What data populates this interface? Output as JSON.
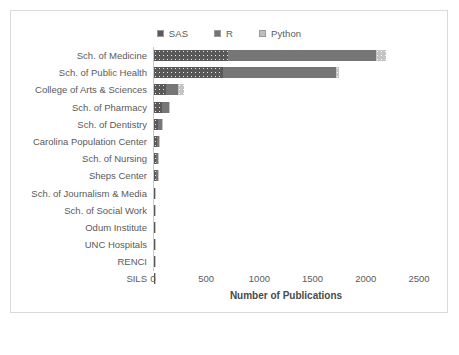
{
  "chart_data": {
    "type": "bar",
    "orientation": "horizontal",
    "stacked": true,
    "title": "",
    "xlabel": "Number of Publications",
    "ylabel": "",
    "xlim": [
      0,
      2500
    ],
    "xticks": [
      0,
      500,
      1000,
      1500,
      2000,
      2500
    ],
    "grid": false,
    "legend_position": "top-center",
    "categories": [
      "Sch. of Medicine",
      "Sch. of Public Health",
      "College of Arts & Sciences",
      "Sch. of Pharmacy",
      "Sch. of Dentistry",
      "Carolina Population Center",
      "Sch. of Nursing",
      "Sheps Center",
      "Sch. of Journalism & Media",
      "Sch. of Social Work",
      "Odum Institute",
      "UNC Hospitals",
      "RENCI",
      "SILS"
    ],
    "series": [
      {
        "name": "SAS",
        "color": "#595959",
        "pattern": "dotted-dark",
        "values": [
          700,
          650,
          110,
          75,
          40,
          25,
          22,
          22,
          8,
          6,
          6,
          5,
          5,
          5
        ]
      },
      {
        "name": "R",
        "color": "#767676",
        "pattern": "solid",
        "values": [
          1390,
          1060,
          115,
          65,
          35,
          18,
          16,
          18,
          6,
          5,
          5,
          4,
          4,
          4
        ]
      },
      {
        "name": "Python",
        "color": "#c4c4c4",
        "pattern": "dotted-light",
        "values": [
          90,
          30,
          55,
          15,
          6,
          4,
          4,
          4,
          2,
          2,
          2,
          2,
          2,
          2
        ]
      }
    ],
    "totals": [
      2180,
      1740,
      280,
      155,
      81,
      47,
      42,
      44,
      16,
      13,
      13,
      11,
      11,
      11
    ]
  },
  "legend": {
    "items": [
      {
        "label": "SAS",
        "swatch_class": "sw-sas"
      },
      {
        "label": "R",
        "swatch_class": "sw-r"
      },
      {
        "label": "Python",
        "swatch_class": "sw-python"
      }
    ]
  },
  "colors": {
    "sas": "#595959",
    "r": "#767676",
    "python": "#c4c4c4",
    "text": "#5a5a5a",
    "axis": "#c9c9c9",
    "border": "#d9d9d9",
    "background": "#ffffff"
  }
}
